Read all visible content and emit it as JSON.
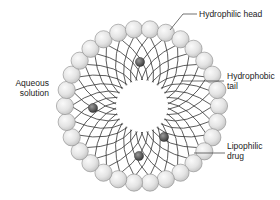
{
  "diagram": {
    "center": {
      "x": 142,
      "y": 106
    },
    "head_ring_radius": 77,
    "head_radius": 8.6,
    "head_count": 30,
    "tail_count": 30,
    "core_radius": 26,
    "colors": {
      "head_fill_light": "#fafafa",
      "head_fill_dark": "#bdbdbd",
      "head_stroke": "#8a8a8a",
      "tail_stroke": "#333333",
      "drug_fill_light": "#9a9a9a",
      "drug_fill_dark": "#2e2e2e",
      "label_text": "#222222"
    },
    "drugs": [
      {
        "x": 140,
        "y": 62,
        "r": 4.6
      },
      {
        "x": 93,
        "y": 108,
        "r": 4.6
      },
      {
        "x": 164,
        "y": 137,
        "r": 4.6
      },
      {
        "x": 139,
        "y": 156,
        "r": 4.6
      }
    ]
  },
  "labels": {
    "hydrophilic_head": "Hydrophilic head",
    "hydrophobic_tail_line1": "Hydrophobic",
    "hydrophobic_tail_line2": "tail",
    "aqueous_line1": "Aqueous",
    "aqueous_line2": "solution",
    "lipophilic_line1": "Lipophilic",
    "lipophilic_line2": "drug"
  }
}
